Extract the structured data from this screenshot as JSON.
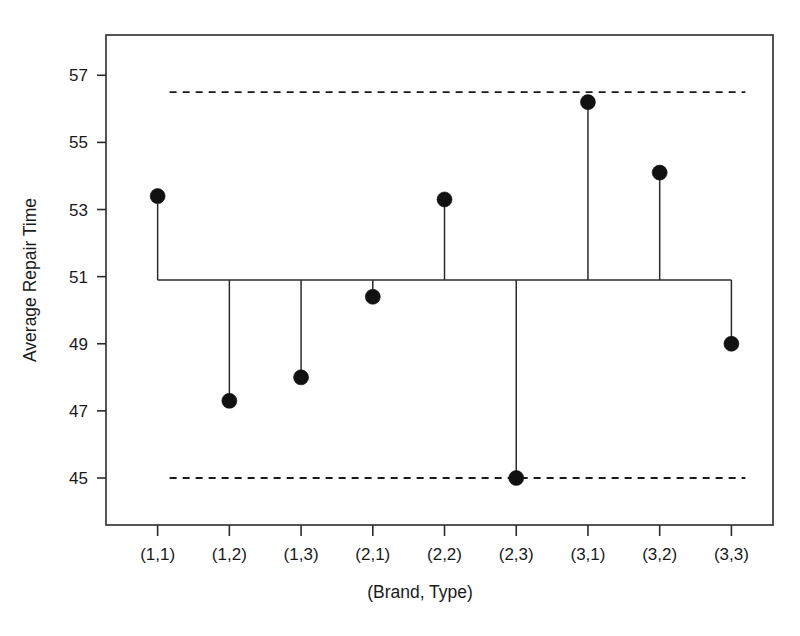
{
  "chart_data": {
    "type": "scatter",
    "title": "",
    "subtitle": "",
    "xlabel": "(Brand, Type)",
    "ylabel": "Average Repair Time",
    "categories": [
      "(1,1)",
      "(1,2)",
      "(1,3)",
      "(2,1)",
      "(2,2)",
      "(2,3)",
      "(3,1)",
      "(3,2)",
      "(3,3)"
    ],
    "values": [
      53.4,
      47.3,
      48.0,
      50.4,
      53.3,
      45.0,
      56.2,
      54.1,
      49.0
    ],
    "series": [
      {
        "name": "Average Repair Time",
        "values": [
          53.4,
          47.3,
          48.0,
          50.4,
          53.3,
          45.0,
          56.2,
          54.1,
          49.0
        ]
      }
    ],
    "center_line": 50.9,
    "upper_decision_limit": 56.5,
    "lower_decision_limit": 45.0,
    "ylim": [
      43.6,
      58.2
    ],
    "ytick_values": [
      45,
      47,
      49,
      51,
      53,
      55,
      57
    ],
    "ytick_labels": [
      "45",
      "47",
      "49",
      "51",
      "53",
      "55",
      "57"
    ],
    "xtick_labels": [
      "(1,1)",
      "(1,2)",
      "(1,3)",
      "(2,1)",
      "(2,2)",
      "(2,3)",
      "(3,1)",
      "(3,2)",
      "(3,3)"
    ],
    "grid": false,
    "legend": "none",
    "marker": "filled-circle",
    "stems_from": "center_line",
    "colors": {
      "marker": "#111111",
      "stem": "#2b2b2b",
      "center_line": "#2b2b2b",
      "limit_line": "#1a1a1a",
      "frame": "#2b2b2b",
      "background": "#ffffff"
    }
  },
  "axes": {
    "y_title": "Average Repair Time",
    "x_title": "(Brand, Type)"
  }
}
